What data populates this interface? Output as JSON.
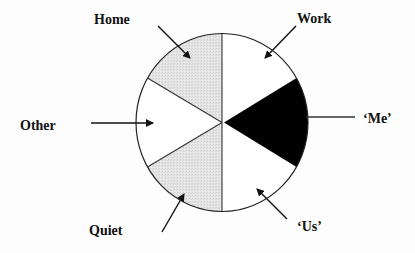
{
  "diagram": {
    "type": "segmented-circle",
    "center": [
      222,
      122.5
    ],
    "radius_x": 86,
    "radius_y": 89,
    "colors": {
      "background": "#fdfdfd",
      "outline": "#222222",
      "shaded": "#e2e2e2",
      "dark": "#000000",
      "white": "#ffffff"
    },
    "segments": [
      {
        "id": "work",
        "label": "Work",
        "fill": "white"
      },
      {
        "id": "me",
        "label": "‘Me’",
        "fill": "black"
      },
      {
        "id": "us",
        "label": "‘Us’",
        "fill": "white"
      },
      {
        "id": "quiet",
        "label": "Quiet",
        "fill": "shaded"
      },
      {
        "id": "other",
        "label": "Other",
        "fill": "white"
      },
      {
        "id": "home",
        "label": "Home",
        "fill": "shaded"
      }
    ],
    "labels": {
      "home": "Home",
      "work": "Work",
      "other": "Other",
      "me": "‘Me’",
      "quiet": "Quiet",
      "us": "‘Us’"
    }
  }
}
